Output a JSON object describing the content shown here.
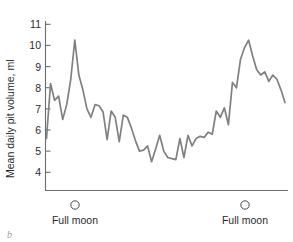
{
  "figure": {
    "panel_letter": "b",
    "line_color": "#808084",
    "axis_color": "#6b6b6b",
    "text_color": "#2b2b2b",
    "background": "#ffffff"
  },
  "chart_data": {
    "type": "line",
    "title": "",
    "xlabel": "",
    "ylabel": "Mean daily pit volume, ml",
    "ylim": [
      3.2,
      11.4
    ],
    "yticks": [
      4,
      5,
      6,
      7,
      8,
      9,
      10,
      11
    ],
    "ytick_labels": [
      "4",
      "5",
      "6",
      "7",
      "8",
      "9",
      "10",
      "11"
    ],
    "xlim": [
      0,
      59
    ],
    "xticks": [],
    "xtick_labels": [],
    "grid": false,
    "legend": false,
    "annotations": [
      {
        "label": "Full moon",
        "x": 12,
        "marker": "open-circle"
      },
      {
        "label": "Full moon",
        "x": 45,
        "marker": "open-circle"
      }
    ],
    "series": [
      {
        "name": "Mean daily pit volume",
        "x": [
          0,
          1,
          2,
          3,
          4,
          5,
          6,
          7,
          8,
          9,
          10,
          11,
          12,
          13,
          14,
          15,
          16,
          17,
          18,
          19,
          20,
          21,
          22,
          23,
          24,
          25,
          26,
          27,
          28,
          29,
          30,
          31,
          32,
          33,
          34,
          35,
          36,
          37,
          38,
          39,
          40,
          41,
          42,
          43,
          44,
          45,
          46,
          47,
          48,
          49,
          50,
          51,
          52,
          53,
          54,
          55,
          56,
          57,
          58,
          59
        ],
        "values": [
          5.6,
          8.2,
          7.4,
          7.6,
          6.5,
          7.2,
          8.4,
          10.25,
          8.6,
          7.9,
          7.0,
          6.6,
          7.2,
          7.15,
          6.85,
          5.55,
          6.9,
          6.6,
          5.45,
          6.7,
          6.6,
          6.1,
          5.5,
          5.0,
          5.05,
          5.25,
          4.5,
          5.1,
          5.75,
          5.0,
          4.7,
          4.65,
          4.6,
          5.6,
          4.7,
          5.75,
          5.25,
          5.6,
          5.7,
          5.65,
          5.9,
          5.8,
          6.9,
          6.6,
          7.05,
          6.25,
          8.25,
          8.0,
          9.35,
          9.9,
          10.25,
          9.5,
          8.85,
          8.6,
          8.75,
          8.3,
          8.6,
          8.4,
          7.9,
          7.3
        ]
      }
    ]
  },
  "axis": {
    "ylabel_text": "Mean daily pit volume, ml",
    "ytick_values": [
      "4",
      "5",
      "6",
      "7",
      "8",
      "9",
      "10",
      "11"
    ]
  },
  "moon_markers": {
    "first_label": "Full moon",
    "second_label": "Full moon"
  }
}
